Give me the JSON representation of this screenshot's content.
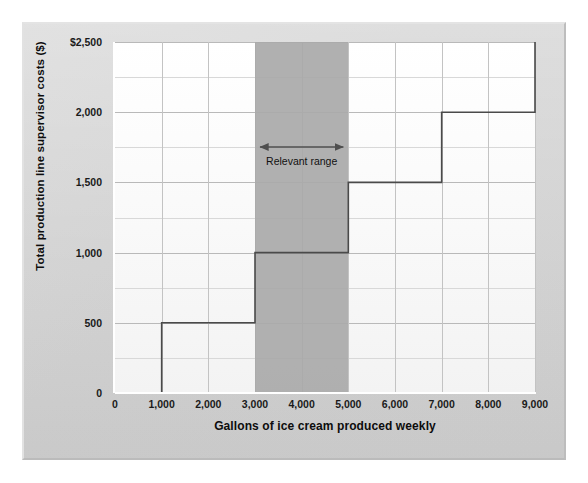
{
  "figure": {
    "background_color": "#d1d1d1",
    "plot_background_color": "#ffffff",
    "band_color": "#a9a9a9",
    "line_color": "#4a4a4a",
    "grid_color": "#b9b9b9"
  },
  "annotation": {
    "relevant_range_label": "Relevant range",
    "arrow_icon": "double-headed-arrow-icon"
  },
  "chart_data": {
    "type": "line",
    "title": "",
    "subtitle": "",
    "xlabel": "Gallons of ice cream produced weekly",
    "ylabel": "Total production line supervisor costs ($)",
    "xlim": [
      0,
      9000
    ],
    "ylim": [
      0,
      2500
    ],
    "grid": true,
    "legend": "none",
    "x_ticks": [
      0,
      1000,
      2000,
      3000,
      4000,
      5000,
      6000,
      7000,
      8000,
      9000
    ],
    "x_tick_labels": [
      "0",
      "1,000",
      "2,000",
      "3,000",
      "4,000",
      "5,000",
      "6,000",
      "7,000",
      "8,000",
      "9,000"
    ],
    "y_ticks": [
      0,
      500,
      1000,
      1500,
      2000,
      2500
    ],
    "y_tick_labels": [
      "0",
      "500",
      "1,000",
      "1,500",
      "2,000",
      "$2,500"
    ],
    "y_minor_tick_interval": 250,
    "series": [
      {
        "name": "Total production line supervisor costs",
        "style": "step-post",
        "steps": [
          {
            "x_start": 0,
            "x_end": 1000,
            "y": 0
          },
          {
            "x_start": 1000,
            "x_end": 3000,
            "y": 500
          },
          {
            "x_start": 3000,
            "x_end": 5000,
            "y": 1000
          },
          {
            "x_start": 5000,
            "x_end": 7000,
            "y": 1500
          },
          {
            "x_start": 7000,
            "x_end": 9000,
            "y": 2000
          },
          {
            "x_start": 9000,
            "x_end": 9000,
            "y": 2500
          }
        ],
        "points": [
          {
            "x": 0,
            "y": 0
          },
          {
            "x": 1000,
            "y": 0
          },
          {
            "x": 1000,
            "y": 500
          },
          {
            "x": 3000,
            "y": 500
          },
          {
            "x": 3000,
            "y": 1000
          },
          {
            "x": 5000,
            "y": 1000
          },
          {
            "x": 5000,
            "y": 1500
          },
          {
            "x": 7000,
            "y": 1500
          },
          {
            "x": 7000,
            "y": 2000
          },
          {
            "x": 9000,
            "y": 2000
          },
          {
            "x": 9000,
            "y": 2500
          }
        ]
      }
    ],
    "annotations": [
      {
        "type": "shaded-band",
        "label": "Relevant range",
        "x_start": 3000,
        "x_end": 5000,
        "color": "#a9a9a9"
      },
      {
        "type": "double-arrow",
        "label": "Relevant range",
        "x_start": 3000,
        "x_end": 5000,
        "y": 1750
      }
    ]
  }
}
